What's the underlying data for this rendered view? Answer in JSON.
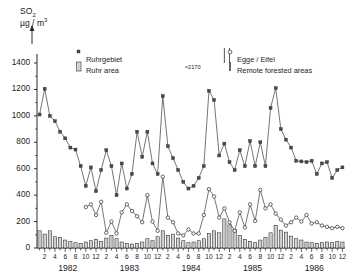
{
  "axis": {
    "title_main": "SO",
    "title_sub": "2",
    "title_units_a": "µg / m",
    "title_units_b": "3",
    "y_ticks": [
      1400,
      1200,
      1000,
      800,
      600,
      400,
      200,
      0
    ],
    "ylim": [
      0,
      1400
    ],
    "month_labels": [
      "2",
      "4",
      "6",
      "8",
      "10",
      "12"
    ],
    "years": [
      "1982",
      "1983",
      "1984",
      "1985",
      "1986"
    ]
  },
  "legend": {
    "items": [
      {
        "marker": "filled-square",
        "name_de": "Ruhrgebiet",
        "name_en": "Ruhr area"
      },
      {
        "marker": "open-circle",
        "name_de": "Egge / Eifel",
        "name_en": "Remote forested areas"
      }
    ]
  },
  "annotations": [
    {
      "text": "≈2170",
      "note": "off-scale peak"
    }
  ],
  "chart_data": {
    "type": "line",
    "title": "SO2 µg / m3",
    "xlabel": "",
    "ylabel": "SO2 µg / m3",
    "ylim": [
      0,
      1400
    ],
    "grid": false,
    "legend_position": "top",
    "x": [
      "1982-01",
      "1982-02",
      "1982-03",
      "1982-04",
      "1982-05",
      "1982-06",
      "1982-07",
      "1982-08",
      "1982-09",
      "1982-10",
      "1982-11",
      "1982-12",
      "1983-01",
      "1983-02",
      "1983-03",
      "1983-04",
      "1983-05",
      "1983-06",
      "1983-07",
      "1983-08",
      "1983-09",
      "1983-10",
      "1983-11",
      "1983-12",
      "1984-01",
      "1984-02",
      "1984-03",
      "1984-04",
      "1984-05",
      "1984-06",
      "1984-07",
      "1984-08",
      "1984-09",
      "1984-10",
      "1984-11",
      "1984-12",
      "1985-01",
      "1985-02",
      "1985-03",
      "1985-04",
      "1985-05",
      "1985-06",
      "1985-07",
      "1985-08",
      "1985-09",
      "1985-10",
      "1985-11",
      "1985-12",
      "1986-01",
      "1986-02",
      "1986-03",
      "1986-04",
      "1986-05",
      "1986-06",
      "1986-07",
      "1986-08",
      "1986-09",
      "1986-10",
      "1986-11",
      "1986-12"
    ],
    "series": [
      {
        "name": "Ruhrgebiet",
        "marker": "filled-square",
        "values": [
          1010,
          1205,
          1000,
          960,
          880,
          830,
          760,
          745,
          620,
          470,
          610,
          430,
          590,
          740,
          620,
          400,
          640,
          450,
          560,
          880,
          690,
          880,
          640,
          560,
          1150,
          770,
          680,
          590,
          500,
          450,
          470,
          530,
          620,
          1190,
          1120,
          700,
          790,
          650,
          590,
          740,
          620,
          810,
          620,
          800,
          620,
          1060,
          1210,
          900,
          820,
          760,
          660,
          655,
          650,
          660,
          560,
          640,
          650,
          530,
          590,
          610
        ]
      },
      {
        "name": "Egge / Eifel",
        "marker": "open-circle",
        "values": [
          null,
          null,
          null,
          null,
          null,
          null,
          null,
          null,
          null,
          310,
          330,
          250,
          350,
          115,
          200,
          110,
          270,
          330,
          280,
          240,
          195,
          400,
          200,
          130,
          540,
          230,
          195,
          110,
          95,
          140,
          110,
          110,
          250,
          445,
          390,
          230,
          300,
          195,
          130,
          270,
          155,
          330,
          205,
          440,
          300,
          330,
          260,
          215,
          170,
          195,
          230,
          200,
          250,
          185,
          195,
          170,
          160,
          150,
          160,
          150
        ]
      }
    ],
    "bar_series": [
      {
        "name": "Ruhr area",
        "style": "hatched",
        "values": [
          130,
          105,
          130,
          85,
          80,
          60,
          50,
          40,
          35,
          45,
          55,
          65,
          50,
          75,
          95,
          70,
          45,
          35,
          30,
          35,
          45,
          70,
          55,
          85,
          130,
          95,
          105,
          75,
          55,
          40,
          45,
          55,
          70,
          110,
          130,
          115,
          220,
          175,
          140,
          95,
          65,
          50,
          40,
          60,
          80,
          115,
          170,
          135,
          120,
          90,
          70,
          60,
          45,
          40,
          35,
          40,
          45,
          40,
          50,
          45
        ]
      },
      {
        "name": "Remote forested areas",
        "style": "solid",
        "values": [
          0,
          0,
          0,
          0,
          0,
          0,
          0,
          0,
          0,
          0,
          0,
          0,
          0,
          0,
          0,
          0,
          0,
          0,
          0,
          0,
          0,
          0,
          0,
          0,
          0,
          0,
          0,
          0,
          0,
          0,
          0,
          0,
          0,
          0,
          0,
          0,
          0,
          0,
          0,
          0,
          0,
          0,
          0,
          0,
          0,
          0,
          0,
          0,
          0,
          0,
          0,
          0,
          0,
          0,
          0,
          0,
          0,
          0,
          0,
          0
        ]
      }
    ],
    "offscale_markers": [
      {
        "x": "1985-01",
        "value": 2170
      },
      {
        "x": "1985-02",
        "value": 2170
      }
    ]
  }
}
